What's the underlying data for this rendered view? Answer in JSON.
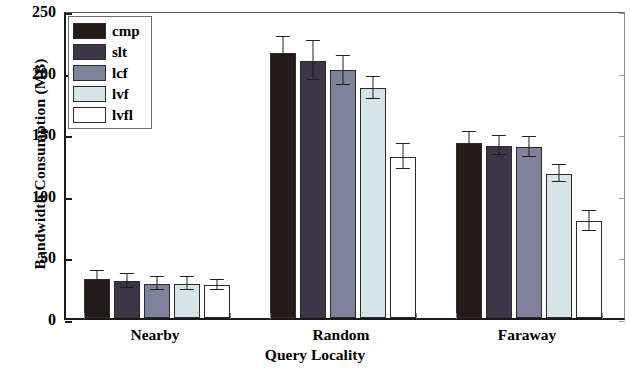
{
  "chart_data": {
    "type": "bar",
    "title": "",
    "xlabel": "Query Locality",
    "ylabel": "Bandwidth Consumption (MB)",
    "categories": [
      "Nearby",
      "Random",
      "Faraway"
    ],
    "ylim": [
      0,
      250
    ],
    "yticks": [
      0,
      50,
      100,
      150,
      200,
      250
    ],
    "ytick_labels": [
      "0",
      "50",
      "100",
      "150",
      "200",
      "250"
    ],
    "grid": false,
    "legend_position": "upper left",
    "error_bars": true,
    "series": [
      {
        "name": "cmp",
        "color": "#241a18",
        "values": [
          32,
          215,
          142
        ],
        "errors": [
          6,
          13,
          9
        ]
      },
      {
        "name": "slt",
        "color": "#3d3547",
        "values": [
          30,
          209,
          140
        ],
        "errors": [
          6,
          16,
          8
        ]
      },
      {
        "name": "lcf",
        "color": "#7d839a",
        "values": [
          28,
          201,
          139
        ],
        "errors": [
          5,
          12,
          8
        ]
      },
      {
        "name": "lvf",
        "color": "#d6e6e8",
        "values": [
          28,
          187,
          117
        ],
        "errors": [
          5,
          9,
          7
        ]
      },
      {
        "name": "lvfl",
        "color": "#ffffff",
        "values": [
          27,
          131,
          79
        ],
        "errors": [
          4,
          10,
          8
        ]
      }
    ]
  },
  "legend": {
    "items": [
      {
        "label": "cmp",
        "color": "#241a18"
      },
      {
        "label": "slt",
        "color": "#3d3547"
      },
      {
        "label": "lcf",
        "color": "#7d839a"
      },
      {
        "label": "lvf",
        "color": "#d6e6e8"
      },
      {
        "label": "lvfl",
        "color": "#ffffff"
      }
    ]
  }
}
